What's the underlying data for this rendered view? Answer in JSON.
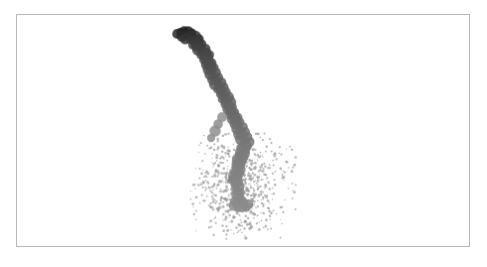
{
  "figure": {
    "background_color": "#ffffff",
    "border_color": "#b9b9b9",
    "frame": {
      "x": 16,
      "y": 14,
      "width": 454,
      "height": 233
    }
  },
  "chart_data": {
    "type": "scatter",
    "title": "",
    "subtitle": "",
    "xlabel": "",
    "ylabel": "",
    "grid": false,
    "legend": null,
    "axes_visible": false,
    "tick_labels": [],
    "xlim": [
      0,
      487
    ],
    "ylim": [
      267,
      0
    ],
    "colormap": {
      "name": "grayscale",
      "start": "#141414",
      "end": "#9a9a9a"
    },
    "series": [
      {
        "name": "trail",
        "marker": "circle",
        "marker_size": 10,
        "opacity": 0.85,
        "color_gradient": true,
        "color_start": "#141414",
        "color_end": "#8f8f8f",
        "points": [
          [
            181,
            32
          ],
          [
            185,
            31
          ],
          [
            189,
            32
          ],
          [
            193,
            33
          ],
          [
            178,
            34
          ],
          [
            183,
            36
          ],
          [
            188,
            35
          ],
          [
            192,
            36
          ],
          [
            196,
            37
          ],
          [
            200,
            39
          ],
          [
            186,
            39
          ],
          [
            191,
            40
          ],
          [
            195,
            41
          ],
          [
            199,
            42
          ],
          [
            203,
            44
          ],
          [
            194,
            45
          ],
          [
            198,
            46
          ],
          [
            202,
            47
          ],
          [
            206,
            49
          ],
          [
            199,
            50
          ],
          [
            203,
            51
          ],
          [
            207,
            53
          ],
          [
            211,
            55
          ],
          [
            202,
            55
          ],
          [
            206,
            57
          ],
          [
            210,
            58
          ],
          [
            205,
            60
          ],
          [
            209,
            62
          ],
          [
            213,
            63
          ],
          [
            207,
            65
          ],
          [
            211,
            66
          ],
          [
            215,
            68
          ],
          [
            209,
            70
          ],
          [
            213,
            71
          ],
          [
            217,
            73
          ],
          [
            211,
            75
          ],
          [
            215,
            77
          ],
          [
            219,
            78
          ],
          [
            214,
            80
          ],
          [
            218,
            82
          ],
          [
            222,
            83
          ],
          [
            216,
            85
          ],
          [
            220,
            87
          ],
          [
            224,
            88
          ],
          [
            218,
            90
          ],
          [
            222,
            92
          ],
          [
            226,
            93
          ],
          [
            221,
            95
          ],
          [
            225,
            97
          ],
          [
            229,
            98
          ],
          [
            223,
            100
          ],
          [
            227,
            102
          ],
          [
            231,
            103
          ],
          [
            226,
            105
          ],
          [
            230,
            107
          ],
          [
            234,
            108
          ],
          [
            228,
            110
          ],
          [
            232,
            112
          ],
          [
            236,
            113
          ],
          [
            231,
            115
          ],
          [
            235,
            117
          ],
          [
            239,
            118
          ],
          [
            233,
            120
          ],
          [
            237,
            122
          ],
          [
            241,
            123
          ],
          [
            236,
            125
          ],
          [
            240,
            127
          ],
          [
            244,
            128
          ],
          [
            238,
            130
          ],
          [
            242,
            132
          ],
          [
            246,
            133
          ],
          [
            240,
            135
          ],
          [
            244,
            137
          ],
          [
            248,
            138
          ],
          [
            242,
            140
          ],
          [
            246,
            142
          ],
          [
            250,
            143
          ],
          [
            244,
            145
          ],
          [
            248,
            147
          ],
          [
            243,
            149
          ],
          [
            247,
            151
          ],
          [
            241,
            153
          ],
          [
            245,
            155
          ],
          [
            240,
            157
          ],
          [
            244,
            159
          ],
          [
            239,
            161
          ],
          [
            243,
            163
          ],
          [
            238,
            165
          ],
          [
            242,
            167
          ],
          [
            237,
            169
          ],
          [
            241,
            171
          ],
          [
            236,
            173
          ],
          [
            240,
            175
          ],
          [
            235,
            177
          ],
          [
            239,
            179
          ],
          [
            234,
            181
          ],
          [
            238,
            183
          ],
          [
            236,
            186
          ],
          [
            240,
            188
          ],
          [
            237,
            191
          ],
          [
            241,
            194
          ],
          [
            238,
            197
          ],
          [
            242,
            200
          ],
          [
            236,
            203
          ],
          [
            240,
            205
          ],
          [
            245,
            204
          ],
          [
            249,
            206
          ],
          [
            243,
            208
          ],
          [
            247,
            209
          ],
          [
            235,
            207
          ],
          [
            239,
            210
          ],
          [
            219,
            125
          ],
          [
            216,
            132
          ],
          [
            212,
            139
          ],
          [
            223,
            118
          ]
        ]
      },
      {
        "name": "cloud",
        "marker": "circle",
        "marker_size": 2,
        "opacity": 0.7,
        "color": "#9a9a9a",
        "center": [
          240,
          186
        ],
        "spread_x": 27,
        "spread_y": 25,
        "count": 620,
        "bounds": {
          "x_min": 190,
          "x_max": 297,
          "y_min": 133,
          "y_max": 241
        }
      }
    ]
  }
}
